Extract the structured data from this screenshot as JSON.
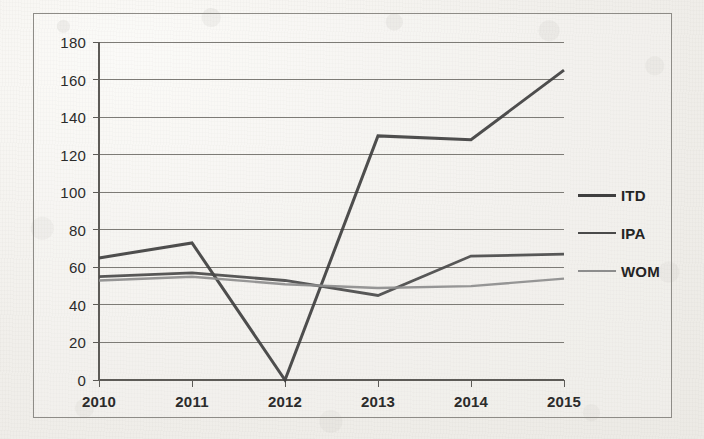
{
  "chart_data": {
    "type": "line",
    "title": "",
    "subtitle": "",
    "xlabel": "",
    "ylabel": "",
    "categories": [
      "2010",
      "2011",
      "2012",
      "2013",
      "2014",
      "2015"
    ],
    "ylim": [
      0,
      180
    ],
    "ytick_step": 20,
    "yticks": [
      "0",
      "20",
      "40",
      "60",
      "80",
      "100",
      "120",
      "140",
      "160",
      "180"
    ],
    "grid": "horizontal",
    "legend_position": "right",
    "series": [
      {
        "name": "ITD",
        "color": "#3f3f3f",
        "width": 3.0,
        "values": [
          65,
          73,
          0,
          130,
          128,
          165
        ]
      },
      {
        "name": "IPA",
        "color": "#4a4a4a",
        "width": 2.8,
        "values": [
          55,
          57,
          53,
          45,
          66,
          67
        ]
      },
      {
        "name": "WOM",
        "color": "#8d8d8d",
        "width": 2.4,
        "values": [
          53,
          55,
          51,
          49,
          50,
          54
        ]
      }
    ]
  },
  "legend": {
    "items": [
      {
        "label": "ITD"
      },
      {
        "label": "IPA"
      },
      {
        "label": "WOM"
      }
    ]
  }
}
